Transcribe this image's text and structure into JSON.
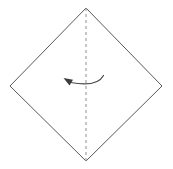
{
  "diagram": {
    "title": "Origami fold step: valley fold square in half along vertical diagonal",
    "canvas": {
      "width": 173,
      "height": 169,
      "background": "#ffffff"
    },
    "shape": {
      "name": "square-rotated-45",
      "label": "Paper square (diamond orientation)",
      "stroke_color": "#595959",
      "fill_color": "#ffffff",
      "stroke_width": 1,
      "vertices": {
        "top": {
          "x": 86,
          "y": 8
        },
        "right": {
          "x": 162,
          "y": 86
        },
        "bottom": {
          "x": 86,
          "y": 161
        },
        "left": {
          "x": 10,
          "y": 86
        }
      },
      "points_attr": "86,8 162,86 86,161 10,86"
    },
    "fold_line": {
      "name": "vertical-fold-crease",
      "label": "Fold crease (dashed)",
      "style": "dashed",
      "color": "#9a9a9a",
      "dash_pattern": "3 3",
      "x": 86,
      "y_start": 8,
      "y_end": 161
    },
    "fold_arrow": {
      "name": "fold-direction-arrow",
      "label": "Fold direction: right half over to the left",
      "direction": "right-to-left",
      "color": "#4a4a4a",
      "arc_path": "M 103.5 75.5 Q 97 87.5 70.5 82.5",
      "head_points": "63.5,78.0 73.0,79.8 69.5,85.5",
      "start": {
        "x": 103.5,
        "y": 75.5
      },
      "end": {
        "x": 65,
        "y": 79
      }
    }
  }
}
